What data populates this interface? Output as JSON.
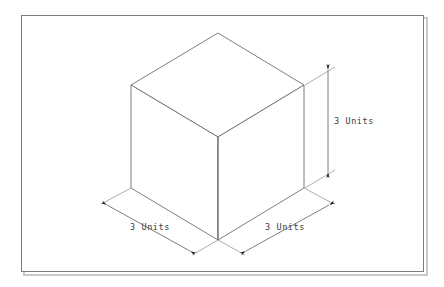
{
  "drawing": {
    "title": "Isometric cube with dimension annotations",
    "background_color": "#ffffff",
    "frame": {
      "name": "page-border",
      "stroke_color": "#808080",
      "shadow_color": "#c8c8c8",
      "x": 21,
      "y": 15,
      "width": 403,
      "height": 257
    },
    "cube": {
      "stroke_color": "#6e6e6e",
      "fill_color": "#ffffff",
      "label": "3 x 3 x 3 unit cube",
      "vertices": {
        "top_back": [
          218,
          33
        ],
        "top_left": [
          131,
          85
        ],
        "top_right": [
          304,
          85
        ],
        "top_front": [
          218,
          137
        ],
        "bottom_left": [
          131,
          188
        ],
        "bottom_right": [
          304,
          188
        ],
        "bottom_front": [
          218,
          240
        ]
      }
    },
    "dimensions": [
      {
        "id": "height",
        "label": "3 Units",
        "orientation": "vertical-right",
        "text_x": 334,
        "text_y": 124,
        "line": {
          "x1": 328,
          "y1": 70,
          "x2": 328,
          "y2": 172
        },
        "extensions": [
          {
            "x1": 304,
            "y1": 85,
            "x2": 334,
            "y2": 67
          },
          {
            "x1": 304,
            "y1": 188,
            "x2": 334,
            "y2": 170
          }
        ]
      },
      {
        "id": "depth-left",
        "label": "3 Units",
        "orientation": "diagonal-left",
        "text_x": 130,
        "text_y": 230,
        "line": {
          "x1": 107,
          "y1": 205,
          "x2": 190,
          "y2": 250
        },
        "extensions": [
          {
            "x1": 131,
            "y1": 188,
            "x2": 104,
            "y2": 203
          },
          {
            "x1": 218,
            "y1": 240,
            "x2": 192,
            "y2": 254
          }
        ]
      },
      {
        "id": "width-right",
        "label": "3 Units",
        "orientation": "diagonal-right",
        "text_x": 265,
        "text_y": 230,
        "line": {
          "x1": 246,
          "y1": 250,
          "x2": 330,
          "y2": 205
        },
        "extensions": [
          {
            "x1": 218,
            "y1": 240,
            "x2": 244,
            "y2": 254
          },
          {
            "x1": 304,
            "y1": 188,
            "x2": 332,
            "y2": 203
          }
        ]
      }
    ],
    "colors": {
      "line": "#6e6e6e",
      "text": "#3c3c3c",
      "frame": "#808080",
      "arrow": "#1a1a1a"
    }
  }
}
